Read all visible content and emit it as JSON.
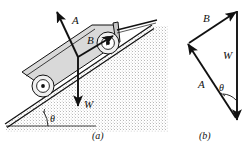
{
  "figure": {
    "background_color": "#ffffff",
    "ink_color": "#111111",
    "cart_fill": "#d9d9d9",
    "ground_fill": "#e8e8e8"
  },
  "panel_a": {
    "caption": "(a)",
    "description": "Cart resting on an inclined plane with three force vectors drawn from a common point on the cart",
    "vectors": [
      {
        "name": "A",
        "label": "A",
        "meaning": "normal-reaction-force",
        "direction": "up-and-left, perpendicular to incline"
      },
      {
        "name": "B",
        "label": "B",
        "meaning": "applied-force-along-incline",
        "direction": "up-the-slope to the right"
      },
      {
        "name": "W",
        "label": "W",
        "meaning": "weight",
        "direction": "straight down"
      }
    ],
    "angle": {
      "label": "θ",
      "meaning": "incline angle between slope and horizontal ground"
    }
  },
  "panel_b": {
    "caption": "(b)",
    "description": "Closed vector triangle of the same three forces",
    "vectors": [
      {
        "name": "B",
        "label": "B",
        "side": "top",
        "direction": "up-and-right"
      },
      {
        "name": "W",
        "label": "W",
        "side": "right",
        "direction": "straight down"
      },
      {
        "name": "A",
        "label": "A",
        "side": "left",
        "direction": "up-and-left"
      }
    ],
    "angle": {
      "label": "θ",
      "meaning": "angle between vector A and vector W at the lower vertex"
    }
  }
}
